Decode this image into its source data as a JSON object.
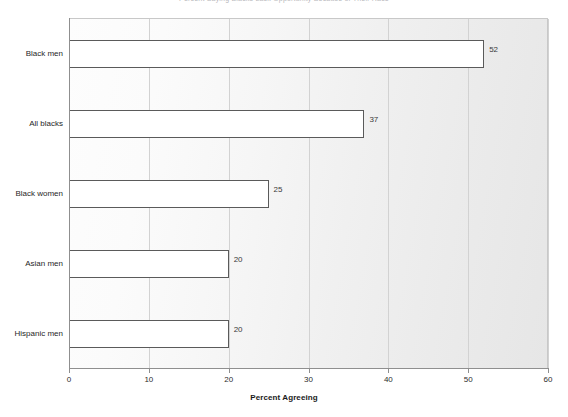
{
  "chart_data": {
    "type": "bar",
    "orientation": "horizontal",
    "title": "Percent Saying Blacks Lack Opportunity Because of Their Race",
    "xlabel": "Percent Agreeing",
    "ylabel": "",
    "categories": [
      "Black men",
      "All blacks",
      "Black women",
      "Asian men",
      "Hispanic men"
    ],
    "values": [
      52,
      37,
      25,
      20,
      20
    ],
    "xlim": [
      0,
      60
    ],
    "xticks": [
      0,
      10,
      20,
      30,
      40,
      50,
      60
    ],
    "xtick_labels": [
      "0",
      "10",
      "20",
      "30",
      "40",
      "50",
      "60"
    ],
    "grid": "vertical",
    "legend": "none",
    "bar_fill": "#ffffff",
    "bar_border": "#5a5a5a",
    "plot_background": "#f2f2f2"
  }
}
